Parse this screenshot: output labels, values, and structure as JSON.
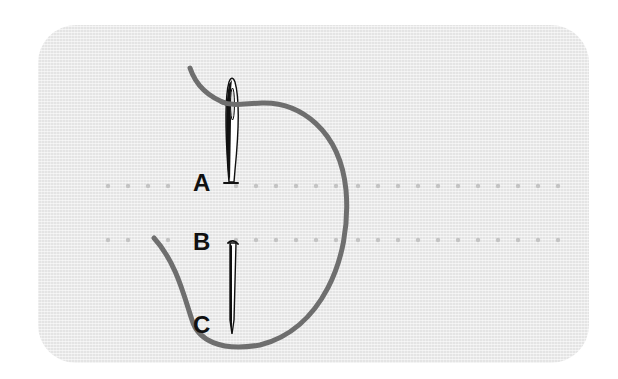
{
  "diagram": {
    "type": "sewing-stitch-instruction",
    "colors": {
      "background": "#ffffff",
      "fabric": "#e4e4e4",
      "thread": "#6e6e6e",
      "needle_outline": "#111111",
      "needle_fill": "#ffffff",
      "stitch_dots": "#c4c4c4",
      "label_text": "#111111"
    },
    "labels": {
      "a": "A",
      "b": "B",
      "c": "C"
    },
    "stitch_rows": [
      {
        "name": "upper-row",
        "y": 186,
        "x_start": 108,
        "x_end": 568,
        "spacing": 20
      },
      {
        "name": "lower-row",
        "y": 240,
        "x_start": 108,
        "x_end": 568,
        "spacing": 20
      }
    ],
    "elements": [
      {
        "name": "fabric-panel",
        "shape": "rounded-rectangle"
      },
      {
        "name": "needle-upper",
        "description": "Needle with eye, tip at point A"
      },
      {
        "name": "needle-lower",
        "description": "Needle shaft entering at B, tip at C"
      },
      {
        "name": "thread",
        "description": "Thread looping from needle eye around to B and C"
      }
    ]
  }
}
